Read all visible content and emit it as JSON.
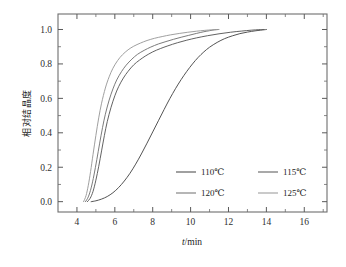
{
  "chart_data": {
    "type": "line",
    "title": "",
    "xlabel": "t/min",
    "xlabel_italic_part": "t",
    "xlabel_rest": "/min",
    "ylabel": "相对结晶度",
    "xlim": [
      3.0,
      17.2
    ],
    "ylim": [
      -0.06,
      1.09
    ],
    "grid": false,
    "legend_position": "inside lower-right",
    "xticks": [
      4,
      6,
      8,
      10,
      12,
      14,
      16
    ],
    "xtick_labels": [
      "4",
      "6",
      "8",
      "10",
      "12",
      "14",
      "16"
    ],
    "xminor_ticks": [
      5,
      7,
      9,
      11,
      13,
      15,
      17
    ],
    "yticks": [
      0.0,
      0.2,
      0.4,
      0.6,
      0.8,
      1.0
    ],
    "ytick_labels": [
      "0.0",
      "0.2",
      "0.4",
      "0.6",
      "0.8",
      "1.0"
    ],
    "yminor_ticks": [
      0.1,
      0.3,
      0.5,
      0.7,
      0.9
    ],
    "series": [
      {
        "name": "110℃",
        "color": "#4a4a4a",
        "x": [
          4.75,
          5.0,
          5.3,
          5.6,
          5.9,
          6.2,
          6.5,
          6.8,
          7.1,
          7.4,
          7.7,
          8.0,
          8.3,
          8.6,
          8.9,
          9.2,
          9.5,
          9.8,
          10.1,
          10.4,
          10.7,
          11.0,
          11.4,
          11.8,
          12.2,
          12.6,
          13.0,
          13.4,
          13.7,
          14.0
        ],
        "y": [
          0.0,
          0.005,
          0.015,
          0.03,
          0.052,
          0.082,
          0.12,
          0.165,
          0.218,
          0.277,
          0.34,
          0.405,
          0.47,
          0.535,
          0.598,
          0.656,
          0.709,
          0.757,
          0.8,
          0.838,
          0.87,
          0.897,
          0.925,
          0.947,
          0.963,
          0.976,
          0.985,
          0.992,
          0.996,
          1.0
        ]
      },
      {
        "name": "115℃",
        "color": "#5a5a5a",
        "x": [
          4.55,
          4.7,
          4.85,
          5.0,
          5.15,
          5.3,
          5.45,
          5.6,
          5.8,
          6.0,
          6.2,
          6.45,
          6.7,
          7.0,
          7.3,
          7.6,
          8.0,
          8.4,
          8.8,
          9.3,
          9.8,
          10.3,
          10.9,
          11.5,
          12.1,
          12.7,
          13.2,
          13.6,
          13.85
        ],
        "y": [
          0.0,
          0.02,
          0.06,
          0.125,
          0.205,
          0.295,
          0.385,
          0.465,
          0.548,
          0.615,
          0.668,
          0.718,
          0.757,
          0.795,
          0.822,
          0.845,
          0.87,
          0.889,
          0.905,
          0.923,
          0.938,
          0.951,
          0.964,
          0.975,
          0.984,
          0.991,
          0.996,
          0.999,
          1.0
        ]
      },
      {
        "name": "120℃",
        "color": "#747474",
        "x": [
          4.45,
          4.6,
          4.75,
          4.9,
          5.05,
          5.2,
          5.35,
          5.5,
          5.7,
          5.9,
          6.1,
          6.35,
          6.6,
          6.9,
          7.2,
          7.55,
          7.9,
          8.3,
          8.7,
          9.1,
          9.5,
          9.9,
          10.3,
          10.7,
          11.0,
          11.25,
          11.45
        ],
        "y": [
          0.0,
          0.028,
          0.08,
          0.155,
          0.245,
          0.34,
          0.43,
          0.508,
          0.59,
          0.655,
          0.707,
          0.755,
          0.793,
          0.828,
          0.856,
          0.879,
          0.898,
          0.916,
          0.93,
          0.943,
          0.955,
          0.966,
          0.977,
          0.987,
          0.993,
          0.998,
          1.0
        ]
      },
      {
        "name": "125℃",
        "color": "#9a9a9a",
        "x": [
          4.35,
          4.48,
          4.6,
          4.72,
          4.85,
          5.0,
          5.15,
          5.3,
          5.5,
          5.7,
          5.9,
          6.15,
          6.4,
          6.7,
          7.0,
          7.35,
          7.7,
          8.1,
          8.5,
          8.95,
          9.4,
          9.85,
          10.3,
          10.75,
          11.1,
          11.35,
          11.5
        ],
        "y": [
          0.0,
          0.035,
          0.095,
          0.175,
          0.275,
          0.385,
          0.487,
          0.572,
          0.66,
          0.725,
          0.775,
          0.82,
          0.853,
          0.882,
          0.903,
          0.921,
          0.936,
          0.949,
          0.959,
          0.969,
          0.977,
          0.984,
          0.99,
          0.995,
          0.998,
          0.999,
          1.0
        ]
      }
    ],
    "legend_entries": [
      {
        "label": "110℃",
        "color": "#4a4a4a"
      },
      {
        "label": "115℃",
        "color": "#5a5a5a"
      },
      {
        "label": "120℃",
        "color": "#747474"
      },
      {
        "label": "125℃",
        "color": "#9a9a9a"
      }
    ]
  }
}
